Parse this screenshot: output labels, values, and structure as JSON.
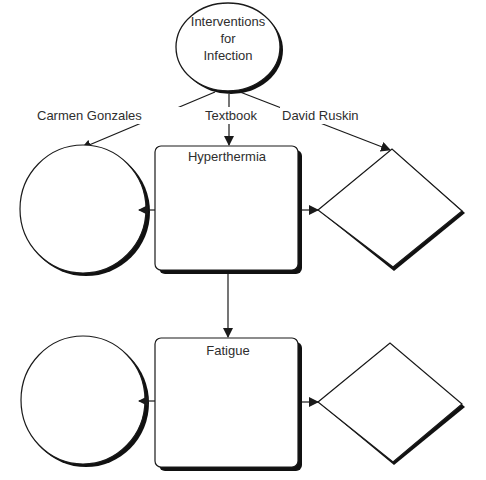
{
  "root": {
    "line1": "Interventions",
    "line2": "for",
    "line3": "Infection"
  },
  "edges": {
    "left": "Carmen Gonzales",
    "middle": "Textbook",
    "right": "David Ruskin"
  },
  "boxes": [
    {
      "title": "Hyperthermia"
    },
    {
      "title": "Fatigue"
    }
  ],
  "colors": {
    "stroke": "#1a1a1a",
    "shadow": "#111111",
    "fill": "#ffffff"
  }
}
